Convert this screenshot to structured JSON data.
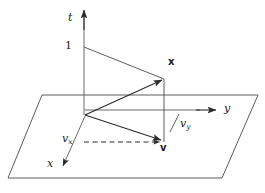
{
  "figure": {
    "background_color": "#ffffff",
    "stroke_color": "#3a3a3a",
    "text_color": "#1a1a1a"
  },
  "axes": [
    {
      "name": "t-axis",
      "label": "t",
      "style": "italic",
      "x": 68,
      "y": 12,
      "size": 11
    },
    {
      "name": "y-axis",
      "label": "y",
      "style": "italic",
      "x": 224,
      "y": 103,
      "size": 11
    },
    {
      "name": "x-axis",
      "label": "x",
      "style": "italic",
      "x": 47,
      "y": 158,
      "size": 11
    }
  ],
  "tick_labels": [
    {
      "name": "unit-tick-t",
      "label": "1",
      "x": 65,
      "y": 40,
      "size": 11
    }
  ],
  "vector_labels": [
    {
      "name": "vector-x-label",
      "label": "x",
      "x": 168,
      "y": 57,
      "size": 10
    },
    {
      "name": "vector-v-label",
      "label": "v",
      "x": 160,
      "y": 143,
      "size": 10
    }
  ],
  "component_labels": [
    {
      "name": "component-vx-label",
      "base": "v",
      "subscript": "x",
      "x": 62,
      "y": 133,
      "size": 11
    },
    {
      "name": "component-vy-label",
      "base": "v",
      "subscript": "y",
      "x": 180,
      "y": 118,
      "size": 11
    }
  ],
  "geometry": {
    "origin": {
      "x": 85,
      "y": 115
    },
    "unit_point_t": {
      "x": 84,
      "y": 47
    },
    "point_x": {
      "x": 163,
      "y": 79
    },
    "point_v": {
      "x": 163,
      "y": 142
    },
    "t_axis_tip": {
      "x": 84,
      "y": 10
    },
    "y_axis_tip": {
      "x": 215,
      "y": 110
    },
    "x_axis_tip": {
      "x": 63,
      "y": 169
    },
    "dash_start": {
      "x": 84,
      "y": 142
    },
    "plane_corners": [
      {
        "x": 42,
        "y": 95
      },
      {
        "x": 258,
        "y": 95
      },
      {
        "x": 222,
        "y": 178
      },
      {
        "x": 8,
        "y": 178
      }
    ],
    "tick_mark": {
      "x1": 170,
      "y1": 131,
      "x2": 180,
      "y2": 114
    }
  }
}
